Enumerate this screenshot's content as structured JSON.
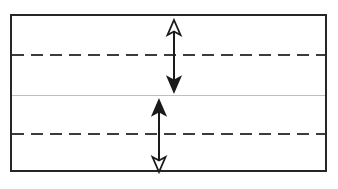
{
  "figure": {
    "title": "",
    "background_color": "#ffffff",
    "width": 338,
    "height": 189
  },
  "diagram": {
    "type": "cross-section-schematic",
    "frame": {
      "name": "outer-rectangle",
      "x": 10,
      "y": 14,
      "width": 317,
      "height": 158,
      "stroke_color": "#262626",
      "stroke_width": 2,
      "fill_color": "#ffffff"
    },
    "lines": [
      {
        "name": "upper-dashed-line",
        "style": "dashed",
        "y": 55,
        "x_start": 11,
        "x_end": 326,
        "stroke_color": "#3c3c3c",
        "stroke_width": 2,
        "dash_length": 12,
        "dash_gap": 7
      },
      {
        "name": "center-solid-line",
        "style": "solid",
        "y": 95,
        "x_start": 11,
        "x_end": 326,
        "stroke_color": "#bfbfbf",
        "stroke_width": 1
      },
      {
        "name": "lower-dashed-line",
        "style": "dashed",
        "y": 134,
        "x_start": 11,
        "x_end": 326,
        "stroke_color": "#3c3c3c",
        "stroke_width": 2,
        "dash_length": 12,
        "dash_gap": 7
      }
    ],
    "arrows": [
      {
        "name": "upper-dimension-arrow",
        "orientation": "vertical",
        "x": 174,
        "y_top": 20,
        "y_bottom": 92,
        "stroke_color": "#1a1a1a",
        "stroke_width": 2,
        "head_top": {
          "style": "hollow",
          "direction": "up",
          "fill": "#ffffff"
        },
        "head_bottom": {
          "style": "solid",
          "direction": "down",
          "fill": "#1a1a1a"
        },
        "label": ""
      },
      {
        "name": "lower-dimension-arrow",
        "orientation": "vertical",
        "x": 159,
        "y_top": 100,
        "y_bottom": 172,
        "stroke_color": "#1a1a1a",
        "stroke_width": 2,
        "head_top": {
          "style": "solid",
          "direction": "up",
          "fill": "#1a1a1a"
        },
        "head_bottom": {
          "style": "hollow",
          "direction": "down",
          "fill": "#ffffff"
        },
        "label": ""
      }
    ]
  }
}
